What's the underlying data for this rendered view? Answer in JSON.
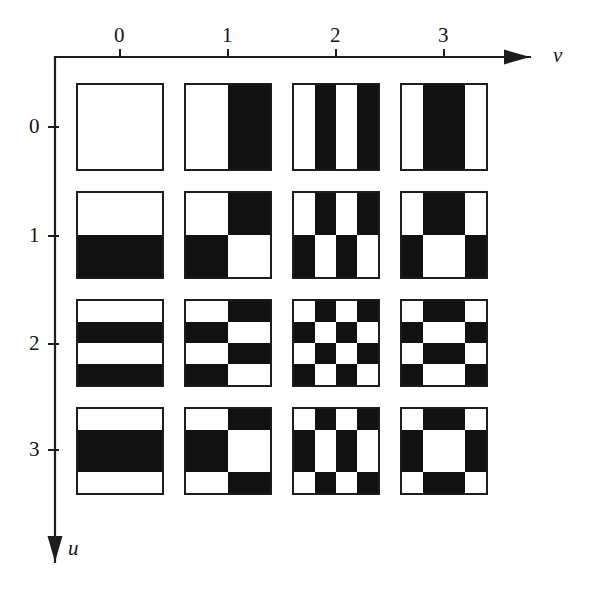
{
  "figure": {
    "title": ""
  },
  "axes": {
    "horizontal": {
      "name": "v",
      "name_style": "italic",
      "direction": "right",
      "arrow_icon": "arrow-right-icon",
      "tick_labels": [
        "0",
        "1",
        "2",
        "3"
      ],
      "tick_positions_px": [
        120,
        228,
        336,
        444
      ],
      "axis_y_px": 57,
      "axis_start_x_px": 55,
      "axis_end_x_px": 530,
      "label_x_px": 553,
      "label_y_px": 45
    },
    "vertical": {
      "name": "u",
      "name_style": "italic",
      "direction": "down",
      "arrow_icon": "arrow-down-icon",
      "tick_labels": [
        "0",
        "1",
        "2",
        "3"
      ],
      "tick_positions_px": [
        127,
        236,
        344,
        450
      ],
      "axis_x_px": 55,
      "axis_start_y_px": 57,
      "axis_end_y_px": 562,
      "label_x_px": 68,
      "label_y_px": 538
    }
  },
  "colors": {
    "ink": "#111111",
    "paper": "#ffffff",
    "border": "#1d1d1d",
    "axis": "#1d1d1d"
  },
  "grid": {
    "rows": 4,
    "cols": 4,
    "cell_size_px": 88,
    "col_origin_px": 76,
    "row_origin_px": 83,
    "pitch_px": 108,
    "sub_resolution": 4
  },
  "chart_data": {
    "type": "heatmap",
    "xlabel": "v",
    "ylabel": "u",
    "x": [
      0,
      1,
      2,
      3
    ],
    "y": [
      0,
      1,
      2,
      3
    ],
    "grid": true,
    "legend": "none",
    "walsh_sequency_rows": {
      "0": [
        1,
        1,
        1,
        1
      ],
      "1": [
        1,
        1,
        -1,
        -1
      ],
      "2": [
        1,
        -1,
        1,
        -1
      ],
      "3": [
        1,
        -1,
        -1,
        1
      ]
    },
    "value_encoding": {
      "1": "white",
      "-1": "black"
    },
    "tiles": [
      {
        "u": 0,
        "v": 0,
        "pixels": [
          [
            1,
            1,
            1,
            1
          ],
          [
            1,
            1,
            1,
            1
          ],
          [
            1,
            1,
            1,
            1
          ],
          [
            1,
            1,
            1,
            1
          ]
        ]
      },
      {
        "u": 0,
        "v": 1,
        "pixels": [
          [
            1,
            1,
            -1,
            -1
          ],
          [
            1,
            1,
            -1,
            -1
          ],
          [
            1,
            1,
            -1,
            -1
          ],
          [
            1,
            1,
            -1,
            -1
          ]
        ]
      },
      {
        "u": 0,
        "v": 2,
        "pixels": [
          [
            1,
            -1,
            1,
            -1
          ],
          [
            1,
            -1,
            1,
            -1
          ],
          [
            1,
            -1,
            1,
            -1
          ],
          [
            1,
            -1,
            1,
            -1
          ]
        ]
      },
      {
        "u": 0,
        "v": 3,
        "pixels": [
          [
            1,
            -1,
            -1,
            1
          ],
          [
            1,
            -1,
            -1,
            1
          ],
          [
            1,
            -1,
            -1,
            1
          ],
          [
            1,
            -1,
            -1,
            1
          ]
        ]
      },
      {
        "u": 1,
        "v": 0,
        "pixels": [
          [
            1,
            1,
            1,
            1
          ],
          [
            1,
            1,
            1,
            1
          ],
          [
            -1,
            -1,
            -1,
            -1
          ],
          [
            -1,
            -1,
            -1,
            -1
          ]
        ]
      },
      {
        "u": 1,
        "v": 1,
        "pixels": [
          [
            1,
            1,
            -1,
            -1
          ],
          [
            1,
            1,
            -1,
            -1
          ],
          [
            -1,
            -1,
            1,
            1
          ],
          [
            -1,
            -1,
            1,
            1
          ]
        ]
      },
      {
        "u": 1,
        "v": 2,
        "pixels": [
          [
            1,
            -1,
            1,
            -1
          ],
          [
            1,
            -1,
            1,
            -1
          ],
          [
            -1,
            1,
            -1,
            1
          ],
          [
            -1,
            1,
            -1,
            1
          ]
        ]
      },
      {
        "u": 1,
        "v": 3,
        "pixels": [
          [
            1,
            -1,
            -1,
            1
          ],
          [
            1,
            -1,
            -1,
            1
          ],
          [
            -1,
            1,
            1,
            -1
          ],
          [
            -1,
            1,
            1,
            -1
          ]
        ]
      },
      {
        "u": 2,
        "v": 0,
        "pixels": [
          [
            1,
            1,
            1,
            1
          ],
          [
            -1,
            -1,
            -1,
            -1
          ],
          [
            1,
            1,
            1,
            1
          ],
          [
            -1,
            -1,
            -1,
            -1
          ]
        ]
      },
      {
        "u": 2,
        "v": 1,
        "pixels": [
          [
            1,
            1,
            -1,
            -1
          ],
          [
            -1,
            -1,
            1,
            1
          ],
          [
            1,
            1,
            -1,
            -1
          ],
          [
            -1,
            -1,
            1,
            1
          ]
        ]
      },
      {
        "u": 2,
        "v": 2,
        "pixels": [
          [
            1,
            -1,
            1,
            -1
          ],
          [
            -1,
            1,
            -1,
            1
          ],
          [
            1,
            -1,
            1,
            -1
          ],
          [
            -1,
            1,
            -1,
            1
          ]
        ]
      },
      {
        "u": 2,
        "v": 3,
        "pixels": [
          [
            1,
            -1,
            -1,
            1
          ],
          [
            -1,
            1,
            1,
            -1
          ],
          [
            1,
            -1,
            -1,
            1
          ],
          [
            -1,
            1,
            1,
            -1
          ]
        ]
      },
      {
        "u": 3,
        "v": 0,
        "pixels": [
          [
            1,
            1,
            1,
            1
          ],
          [
            -1,
            -1,
            -1,
            -1
          ],
          [
            -1,
            -1,
            -1,
            -1
          ],
          [
            1,
            1,
            1,
            1
          ]
        ]
      },
      {
        "u": 3,
        "v": 1,
        "pixels": [
          [
            1,
            1,
            -1,
            -1
          ],
          [
            -1,
            -1,
            1,
            1
          ],
          [
            -1,
            -1,
            1,
            1
          ],
          [
            1,
            1,
            -1,
            -1
          ]
        ]
      },
      {
        "u": 3,
        "v": 2,
        "pixels": [
          [
            1,
            -1,
            1,
            -1
          ],
          [
            -1,
            1,
            -1,
            1
          ],
          [
            -1,
            1,
            -1,
            1
          ],
          [
            1,
            -1,
            1,
            -1
          ]
        ]
      },
      {
        "u": 3,
        "v": 3,
        "pixels": [
          [
            1,
            -1,
            -1,
            1
          ],
          [
            -1,
            1,
            1,
            -1
          ],
          [
            -1,
            1,
            1,
            -1
          ],
          [
            1,
            -1,
            -1,
            1
          ]
        ]
      }
    ]
  }
}
